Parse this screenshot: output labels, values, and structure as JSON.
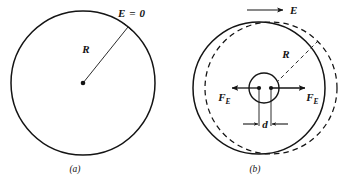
{
  "figure": {
    "background_color": "#ffffff",
    "ink_color": "#141414",
    "panels": [
      {
        "id": "a",
        "caption": "(a)",
        "labels": {
          "field_label": "E = 0",
          "radius_label": "R"
        },
        "elements": {
          "outer_circle": "solid",
          "center_dot": "filled",
          "radius_leader": "solid"
        }
      },
      {
        "id": "b",
        "caption": "(b)",
        "labels": {
          "field_label": "E",
          "radius_label": "R",
          "force_left_base": "F",
          "force_left_sub": "E",
          "force_right_base": "F",
          "force_right_sub": "E",
          "separation_label": "d"
        },
        "elements": {
          "electron_cloud_circle": "solid",
          "positive_core_circle": "dashed",
          "inner_circle": "solid",
          "field_arrow": "right",
          "force_arrow_left": "left",
          "force_arrow_right": "right",
          "dimension_arrows": "inward"
        }
      }
    ]
  }
}
